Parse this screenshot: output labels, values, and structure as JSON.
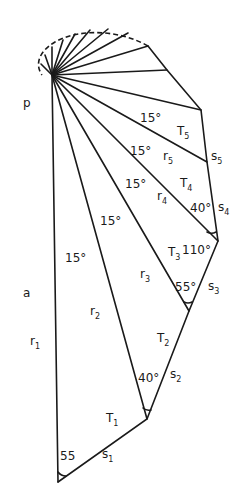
{
  "diagram": {
    "pole_label": "p",
    "axis_label": "a",
    "center": [
      52,
      75
    ],
    "vertices": [
      [
        58,
        482
      ],
      [
        147,
        419
      ],
      [
        189,
        311
      ],
      [
        218,
        241
      ],
      [
        207,
        162
      ],
      [
        201,
        110
      ],
      [
        167,
        70
      ],
      [
        148,
        46
      ]
    ],
    "radii_labels": [
      {
        "text": "r",
        "sub": "1",
        "x": 30,
        "y": 345
      },
      {
        "text": "r",
        "sub": "2",
        "x": 90,
        "y": 315
      },
      {
        "text": "r",
        "sub": "3",
        "x": 140,
        "y": 278
      },
      {
        "text": "r",
        "sub": "4",
        "x": 157,
        "y": 200
      },
      {
        "text": "r",
        "sub": "5",
        "x": 163,
        "y": 160
      }
    ],
    "triangle_labels": [
      {
        "text": "T",
        "sub": "1",
        "x": 106,
        "y": 422
      },
      {
        "text": "T",
        "sub": "2",
        "x": 157,
        "y": 342
      },
      {
        "text": "T",
        "sub": "3",
        "x": 168,
        "y": 256
      },
      {
        "text": "T",
        "sub": "4",
        "x": 180,
        "y": 187
      },
      {
        "text": "T",
        "sub": "5",
        "x": 177,
        "y": 135
      }
    ],
    "side_labels": [
      {
        "text": "s",
        "sub": "1",
        "x": 102,
        "y": 458
      },
      {
        "text": "s",
        "sub": "2",
        "x": 170,
        "y": 378
      },
      {
        "text": "s",
        "sub": "3",
        "x": 208,
        "y": 290
      },
      {
        "text": "s",
        "sub": "4",
        "x": 218,
        "y": 211
      },
      {
        "text": "s",
        "sub": "5",
        "x": 211,
        "y": 160
      }
    ],
    "angle_labels": [
      {
        "text": "15°",
        "x": 65,
        "y": 262
      },
      {
        "text": "15°",
        "x": 100,
        "y": 225
      },
      {
        "text": "15°",
        "x": 125,
        "y": 188
      },
      {
        "text": "15°",
        "x": 130,
        "y": 155
      },
      {
        "text": "15°",
        "x": 140,
        "y": 122
      },
      {
        "text": "55",
        "x": 60,
        "y": 460
      },
      {
        "text": "40°",
        "x": 138,
        "y": 382
      },
      {
        "text": "55°",
        "x": 175,
        "y": 291
      },
      {
        "text": "110°",
        "x": 182,
        "y": 254
      },
      {
        "text": "40°",
        "x": 190,
        "y": 212
      }
    ]
  }
}
